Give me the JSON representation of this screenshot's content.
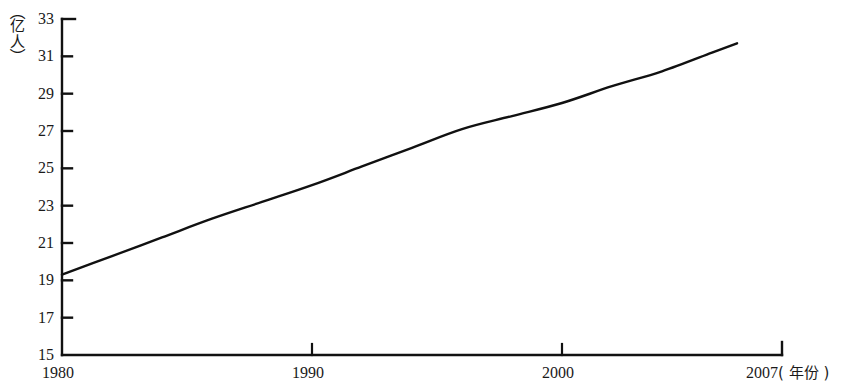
{
  "chart_data": {
    "type": "line",
    "title": "",
    "subtitle": "",
    "xlabel": "年份",
    "ylabel": "亿人",
    "xlabel_full": "2007( 年份 )",
    "ylabel_full": "（亿人）",
    "xlim": [
      1980,
      2008.8
    ],
    "ylim": [
      15,
      33
    ],
    "grid": false,
    "legend": null,
    "legend_position": "none",
    "x_ticks": [
      1980,
      1990,
      2000,
      2007
    ],
    "x_tick_labels": [
      "1980",
      "1990",
      "2000",
      "2007"
    ],
    "y_ticks": [
      15,
      17,
      19,
      21,
      23,
      25,
      27,
      29,
      31,
      33
    ],
    "y_tick_labels": [
      "15",
      "17",
      "19",
      "21",
      "23",
      "25",
      "27",
      "29",
      "31",
      "33"
    ],
    "series": [
      {
        "name": "人口",
        "color": "#111111",
        "x": [
          1980,
          1982,
          1984,
          1986,
          1988,
          1990,
          1992,
          1994,
          1996,
          1998,
          2000,
          2002,
          2004,
          2006,
          2007
        ],
        "values": [
          19.3,
          20.3,
          21.3,
          22.3,
          23.2,
          24.1,
          25.1,
          26.1,
          27.1,
          27.8,
          28.5,
          29.4,
          30.2,
          31.2,
          31.7
        ]
      }
    ]
  },
  "axis": {
    "y_unit_open_paren": "（",
    "y_unit_char_1": "亿",
    "y_unit_char_2": "人",
    "y_unit_close_paren": "）",
    "x_end_year": "2007",
    "x_end_unit": "( 年份 )"
  },
  "style": {
    "background": "#ffffff",
    "axis_color": "#111111",
    "line_color": "#111111",
    "text_color": "#1a1a1a"
  }
}
